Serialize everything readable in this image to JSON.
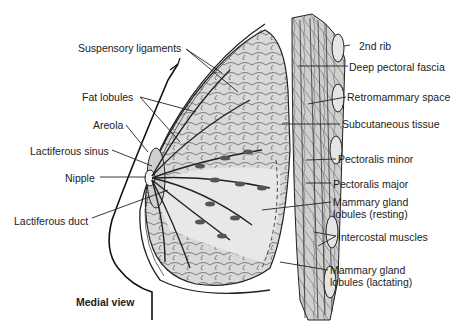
{
  "figure": {
    "caption": "Medial view",
    "labels_left": [
      {
        "id": "suspensory-ligaments",
        "text": "Suspensory ligaments",
        "x": 78,
        "y": 42
      },
      {
        "id": "fat-lobules",
        "text": "Fat lobules",
        "x": 82,
        "y": 91
      },
      {
        "id": "areola",
        "text": "Areola",
        "x": 93,
        "y": 120
      },
      {
        "id": "lactiferous-sinus",
        "text": "Lactiferous sinus",
        "x": 30,
        "y": 145
      },
      {
        "id": "nipple",
        "text": "Nipple",
        "x": 65,
        "y": 172
      },
      {
        "id": "lactiferous-duct",
        "text": "Lactiferous duct",
        "x": 14,
        "y": 215
      }
    ],
    "labels_right": [
      {
        "id": "2nd-rib",
        "text": "2nd rib",
        "x": 351,
        "y": 41
      },
      {
        "id": "deep-pectoral-fascia",
        "text": "Deep pectoral fascia",
        "x": 349,
        "y": 62
      },
      {
        "id": "retromammary-space",
        "text": "Retromammary space",
        "x": 347,
        "y": 92
      },
      {
        "id": "subcutaneous-tissue",
        "text": "Subcutaneous tissue",
        "x": 342,
        "y": 119
      },
      {
        "id": "pectoralis-minor",
        "text": "Pectoralis minor",
        "x": 338,
        "y": 154
      },
      {
        "id": "pectoralis-major",
        "text": "Pectoralis major",
        "x": 333,
        "y": 179
      },
      {
        "id": "mammary-gland-lobules-resting",
        "text": "Mammary gland",
        "text2": "lobules (resting)",
        "x": 333,
        "y": 197
      },
      {
        "id": "intercostal-muscles",
        "text": "Intercostal muscles",
        "x": 338,
        "y": 231
      },
      {
        "id": "mammary-gland-lobules-lactating",
        "text": "Mammary gland",
        "text2": "lobules (lactating)",
        "x": 330,
        "y": 264
      }
    ]
  }
}
